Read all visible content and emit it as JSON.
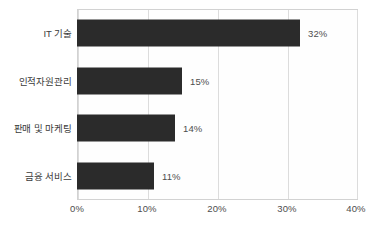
{
  "chart_data": {
    "type": "bar",
    "orientation": "horizontal",
    "title": "",
    "xlabel": "",
    "ylabel": "",
    "categories": [
      "IT 기술",
      "인적자원관리",
      "판매 및 마케팅",
      "금융 서비스"
    ],
    "values": [
      32,
      15,
      14,
      11
    ],
    "value_labels": [
      "32%",
      "15%",
      "14%",
      "11%"
    ],
    "xlim": [
      0,
      40
    ],
    "xticks": [
      0,
      10,
      20,
      30,
      40
    ],
    "xtick_labels": [
      "0%",
      "10%",
      "20%",
      "30%",
      "40%"
    ],
    "grid": true,
    "grid_axis": "x",
    "legend": false,
    "legend_position": "none",
    "bar_color": "#2b2b2b",
    "grid_color": "#dcdcdc",
    "frame_color": "#d2d2d2",
    "tick_label_color": "#4e4e4e",
    "category_label_color": "#3b3b3b"
  }
}
